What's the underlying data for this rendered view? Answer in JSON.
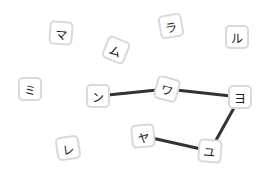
{
  "board": {
    "background": "#ffffff",
    "tile_border_color": "#d9d9d9",
    "line_color": "#333333",
    "tiles": [
      {
        "id": "ma",
        "char": "マ",
        "x": 61,
        "y": 33,
        "rot": 4
      },
      {
        "id": "mu",
        "char": "ム",
        "x": 116,
        "y": 50,
        "rot": 22
      },
      {
        "id": "ra",
        "char": "ラ",
        "x": 171,
        "y": 26,
        "rot": -10
      },
      {
        "id": "ru",
        "char": "ル",
        "x": 237,
        "y": 37,
        "rot": 0
      },
      {
        "id": "mi",
        "char": "ミ",
        "x": 30,
        "y": 89,
        "rot": 0
      },
      {
        "id": "n",
        "char": "ン",
        "x": 98,
        "y": 96,
        "rot": 0
      },
      {
        "id": "wa",
        "char": "ワ",
        "x": 167,
        "y": 89,
        "rot": 15
      },
      {
        "id": "yo",
        "char": "ヨ",
        "x": 240,
        "y": 97,
        "rot": 0
      },
      {
        "id": "re",
        "char": "レ",
        "x": 68,
        "y": 148,
        "rot": -8
      },
      {
        "id": "ya",
        "char": "ヤ",
        "x": 143,
        "y": 136,
        "rot": -5
      },
      {
        "id": "yu",
        "char": "ユ",
        "x": 210,
        "y": 151,
        "rot": 5
      }
    ],
    "connections": [
      [
        "n",
        "wa"
      ],
      [
        "wa",
        "yo"
      ],
      [
        "yo",
        "yu"
      ],
      [
        "yu",
        "ya"
      ]
    ]
  }
}
